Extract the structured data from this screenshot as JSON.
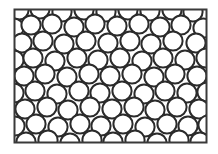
{
  "figure": {
    "kind": "microstructure-schematic",
    "background_color": "#ffffff",
    "outline_color": "#2b2b2b",
    "circle_fill": "#ffffff",
    "frame_stroke_color": "#3a3a3a"
  },
  "frame": {
    "x": 14.5,
    "y": 9.5,
    "width": 192,
    "height": 133,
    "stroke_width": 2.0,
    "fill": "#fefefe"
  },
  "circles": {
    "count": 82,
    "radius": 9.6,
    "stroke_width": 2.0,
    "stroke_color": "#2b2b2b",
    "fill": "#ffffff",
    "points": [
      [
        19,
        10
      ],
      [
        40,
        9
      ],
      [
        62,
        12
      ],
      [
        84,
        10
      ],
      [
        106,
        12
      ],
      [
        128,
        10
      ],
      [
        150,
        11
      ],
      [
        172,
        10
      ],
      [
        193,
        12
      ],
      [
        14,
        28
      ],
      [
        31,
        25
      ],
      [
        52,
        24
      ],
      [
        74,
        27
      ],
      [
        95,
        24
      ],
      [
        117,
        26
      ],
      [
        139,
        24
      ],
      [
        160,
        27
      ],
      [
        181,
        25
      ],
      [
        203,
        28
      ],
      [
        22,
        43
      ],
      [
        43,
        41
      ],
      [
        64,
        44
      ],
      [
        86,
        41
      ],
      [
        108,
        43
      ],
      [
        130,
        41
      ],
      [
        151,
        44
      ],
      [
        173,
        41
      ],
      [
        196,
        43
      ],
      [
        14,
        60
      ],
      [
        33,
        58
      ],
      [
        55,
        61
      ],
      [
        77,
        58
      ],
      [
        98,
        60
      ],
      [
        120,
        58
      ],
      [
        142,
        61
      ],
      [
        163,
        58
      ],
      [
        185,
        60
      ],
      [
        206,
        58
      ],
      [
        24,
        76
      ],
      [
        45,
        74
      ],
      [
        67,
        77
      ],
      [
        89,
        74
      ],
      [
        110,
        76
      ],
      [
        132,
        74
      ],
      [
        154,
        77
      ],
      [
        175,
        74
      ],
      [
        197,
        76
      ],
      [
        14,
        93
      ],
      [
        35,
        91
      ],
      [
        57,
        94
      ],
      [
        79,
        91
      ],
      [
        100,
        93
      ],
      [
        122,
        91
      ],
      [
        144,
        94
      ],
      [
        165,
        91
      ],
      [
        187,
        93
      ],
      [
        207,
        92
      ],
      [
        25,
        109
      ],
      [
        47,
        107
      ],
      [
        68,
        110
      ],
      [
        90,
        107
      ],
      [
        112,
        109
      ],
      [
        134,
        107
      ],
      [
        155,
        110
      ],
      [
        177,
        107
      ],
      [
        199,
        109
      ],
      [
        15,
        126
      ],
      [
        36,
        124
      ],
      [
        58,
        127
      ],
      [
        80,
        124
      ],
      [
        101,
        126
      ],
      [
        123,
        124
      ],
      [
        145,
        127
      ],
      [
        167,
        124
      ],
      [
        188,
        126
      ],
      [
        208,
        125
      ],
      [
        26,
        142
      ],
      [
        48,
        140
      ],
      [
        70,
        143
      ],
      [
        92,
        140
      ],
      [
        113,
        142
      ],
      [
        135,
        140
      ],
      [
        157,
        143
      ],
      [
        179,
        140
      ],
      [
        200,
        142
      ]
    ]
  }
}
